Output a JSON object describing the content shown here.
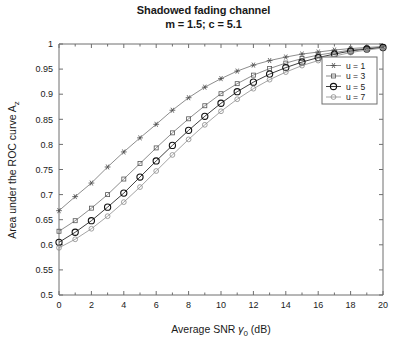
{
  "chart_data": {
    "type": "line",
    "title": "Shadowed fading channel",
    "subtitle": "m = 1.5; c = 5.1",
    "xlabel_prefix": "Average SNR ",
    "xlabel_symbol": "γ",
    "xlabel_sub": "0",
    "xlabel_suffix": " (dB)",
    "ylabel_prefix": "Area under the ROC curve A",
    "ylabel_sub": "z",
    "xlim": [
      0,
      20
    ],
    "ylim": [
      0.5,
      1
    ],
    "xticks": [
      "0",
      "2",
      "4",
      "6",
      "8",
      "10",
      "12",
      "14",
      "16",
      "18",
      "20"
    ],
    "xtick_values": [
      0,
      2,
      4,
      6,
      8,
      10,
      12,
      14,
      16,
      18,
      20
    ],
    "yticks": [
      "0.5",
      "0.55",
      "0.6",
      "0.65",
      "0.7",
      "0.75",
      "0.8",
      "0.85",
      "0.9",
      "0.95",
      "1"
    ],
    "ytick_values": [
      0.5,
      0.55,
      0.6,
      0.65,
      0.7,
      0.75,
      0.8,
      0.85,
      0.9,
      0.95,
      1.0
    ],
    "grid": false,
    "legend_position": "right-top",
    "x": [
      0,
      1,
      2,
      3,
      4,
      5,
      6,
      7,
      8,
      9,
      10,
      11,
      12,
      13,
      14,
      15,
      16,
      17,
      18,
      19,
      20
    ],
    "series": [
      {
        "name": "u = 1",
        "marker": "star",
        "color": "#808080",
        "values": [
          0.668,
          0.696,
          0.723,
          0.755,
          0.785,
          0.813,
          0.84,
          0.868,
          0.893,
          0.914,
          0.931,
          0.946,
          0.958,
          0.967,
          0.974,
          0.98,
          0.984,
          0.988,
          0.991,
          0.993,
          0.995
        ]
      },
      {
        "name": "u = 3",
        "marker": "square",
        "color": "#808080",
        "values": [
          0.627,
          0.648,
          0.673,
          0.7,
          0.731,
          0.762,
          0.793,
          0.823,
          0.851,
          0.877,
          0.901,
          0.921,
          0.938,
          0.951,
          0.962,
          0.971,
          0.978,
          0.983,
          0.988,
          0.991,
          0.994
        ]
      },
      {
        "name": "u = 5",
        "marker": "circle-big",
        "color": "#2a2a2a",
        "values": [
          0.605,
          0.625,
          0.648,
          0.675,
          0.703,
          0.735,
          0.767,
          0.798,
          0.828,
          0.856,
          0.882,
          0.905,
          0.924,
          0.94,
          0.953,
          0.964,
          0.973,
          0.98,
          0.986,
          0.99,
          0.993
        ]
      },
      {
        "name": "u = 7",
        "marker": "circle-small",
        "color": "#9a9a9a",
        "values": [
          0.594,
          0.611,
          0.632,
          0.657,
          0.685,
          0.715,
          0.747,
          0.779,
          0.81,
          0.839,
          0.866,
          0.89,
          0.911,
          0.929,
          0.944,
          0.957,
          0.967,
          0.976,
          0.983,
          0.988,
          0.992
        ]
      }
    ]
  },
  "legend": {
    "items": [
      {
        "label": "u = 1"
      },
      {
        "label": "u = 3"
      },
      {
        "label": "u = 5"
      },
      {
        "label": "u = 7"
      }
    ]
  }
}
